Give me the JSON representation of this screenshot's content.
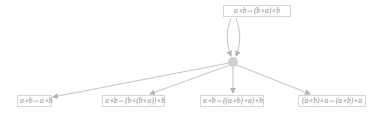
{
  "diagram": {
    "type": "proof-graph",
    "colors": {
      "edge": "#b4b4b4",
      "hub": "#cfcfcf",
      "label_text": "#8a8a8a",
      "label_border": "#d6d6d6"
    },
    "top_node": {
      "label": "a∘b⇔(b∘a)∘b"
    },
    "hub_node": {
      "label": ""
    },
    "bottom_nodes": [
      {
        "label": "a∘b⇔a∘b"
      },
      {
        "label": "a∘b⇔(b∘(b∘a))∘b"
      },
      {
        "label": "a∘b⇔((a∘b)∘a)∘b"
      },
      {
        "label": "(a∘b)∘a⇔(a∘b)∘a"
      }
    ],
    "edges": [
      {
        "from": "top_node",
        "to": "hub_node"
      },
      {
        "from": "top_node",
        "to": "hub_node"
      },
      {
        "from": "hub_node",
        "to": "bottom_nodes.0"
      },
      {
        "from": "hub_node",
        "to": "bottom_nodes.1"
      },
      {
        "from": "hub_node",
        "to": "bottom_nodes.2"
      },
      {
        "from": "hub_node",
        "to": "bottom_nodes.3"
      }
    ]
  }
}
